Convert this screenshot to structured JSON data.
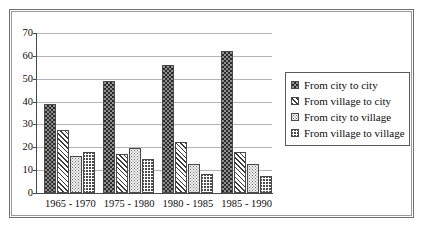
{
  "chart_data": {
    "type": "bar",
    "title": "",
    "subtitle": "",
    "xlabel": "",
    "ylabel": "",
    "ylim": [
      0,
      70
    ],
    "ytick_step": 10,
    "yticks": [
      "0",
      "10",
      "20",
      "30",
      "40",
      "50",
      "60",
      "70"
    ],
    "grid": "horizontal",
    "legend_position": "right",
    "categories": [
      "1965 - 1970",
      "1975 - 1980",
      "1980 - 1985",
      "1985 - 1990"
    ],
    "series": [
      {
        "name": "From city to city",
        "pattern": "dark-checkerboard",
        "values": [
          39,
          49,
          56,
          62
        ]
      },
      {
        "name": "From village to city",
        "pattern": "diagonal-hatch",
        "values": [
          27.5,
          17,
          22.5,
          18
        ]
      },
      {
        "name": "From city to village",
        "pattern": "light-dots",
        "values": [
          16,
          19.5,
          12.5,
          12.5
        ]
      },
      {
        "name": "From village to village",
        "pattern": "wavy-zigzag",
        "values": [
          18,
          15,
          8.5,
          7.5
        ]
      }
    ]
  },
  "colors": {
    "axis": "#4a4a4a",
    "gridline": "#b4b4b4",
    "frame_outer": "#6f6f6f",
    "frame_inner": "#9a9a9a",
    "text": "#0d0d0d",
    "background": "#ffffff"
  }
}
